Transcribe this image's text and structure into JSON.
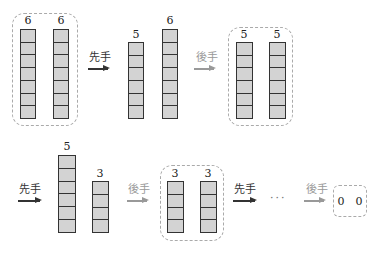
{
  "diagram": {
    "labels": {
      "first_player": "先手",
      "second_player": "後手",
      "ellipsis": "···"
    },
    "colors": {
      "cell_fill": "#d3d3d3",
      "cell_border": "#333333",
      "first_arrow": "#333333",
      "second_arrow": "#999999",
      "dashed_group": "#aaaaaa"
    },
    "states": [
      {
        "piles": [
          6,
          6
        ],
        "grouped": true
      },
      {
        "piles": [
          5,
          6
        ],
        "grouped": false
      },
      {
        "piles": [
          5,
          5
        ],
        "grouped": true
      },
      {
        "piles": [
          5,
          3
        ],
        "grouped": false
      },
      {
        "piles": [
          3,
          3
        ],
        "grouped": true
      },
      {
        "piles": [
          0,
          0
        ],
        "grouped": true
      }
    ],
    "row1": {
      "s1": {
        "a": "6",
        "b": "6"
      },
      "move1": "先手",
      "s2": {
        "a": "5",
        "b": "6"
      },
      "move2": "後手",
      "s3": {
        "a": "5",
        "b": "5"
      }
    },
    "row2": {
      "move1": "先手",
      "s4": {
        "a": "5",
        "b": "3"
      },
      "move2": "後手",
      "s5": {
        "a": "3",
        "b": "3"
      },
      "move3": "先手",
      "ellipsis": "···",
      "move4": "後手",
      "s6": {
        "a": "0",
        "b": "0"
      }
    }
  }
}
